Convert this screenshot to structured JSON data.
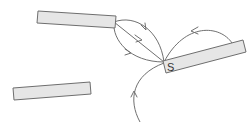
{
  "diagram": {
    "type": "magnetic field lines",
    "magnets": [
      {
        "id": "magnet-top-left",
        "label": "",
        "corners": [
          [
            38,
            11
          ],
          [
            116,
            16
          ],
          [
            115,
            28
          ],
          [
            37,
            23
          ]
        ]
      },
      {
        "id": "magnet-right",
        "label": "S",
        "label_end": "left",
        "corners": [
          [
            163,
            61
          ],
          [
            243,
            40
          ],
          [
            246,
            52
          ],
          [
            166,
            73
          ]
        ]
      },
      {
        "id": "magnet-bottom-left",
        "label": "",
        "corners": [
          [
            13,
            88
          ],
          [
            90,
            82
          ],
          [
            91,
            94
          ],
          [
            14,
            100
          ]
        ]
      }
    ],
    "field_lines": [
      {
        "from": "magnet-top-left right end",
        "to": "magnet-right S end",
        "shape": "upper arc",
        "arrow_direction": "toward S"
      },
      {
        "from": "magnet-top-left right end",
        "to": "magnet-right S end",
        "shape": "straight diagonal",
        "arrow_direction": "toward S"
      },
      {
        "from": "magnet-top-left right end",
        "to": "magnet-right S end",
        "shape": "lower arc",
        "arrow_direction": "toward S"
      },
      {
        "from": "magnet-right right end",
        "to": "magnet-right S end",
        "shape": "arc over top",
        "arrow_direction": "toward S"
      },
      {
        "from": "bottom edge",
        "to": "magnet-right S end",
        "shape": "rising curve",
        "arrow_direction": "upward"
      }
    ],
    "colors": {
      "magnet_fill": "#e6e6e6",
      "magnet_stroke": "#6e6e6e",
      "line": "#707070",
      "label": "#333333",
      "background": "#ffffff"
    }
  }
}
